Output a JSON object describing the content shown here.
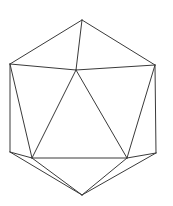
{
  "figure": {
    "stroke_color": "#3a3a3a",
    "background": "#ffffff",
    "vertices": {
      "top": [
        82,
        20
      ],
      "upper_left": [
        10,
        64
      ],
      "upper_right": [
        155,
        65
      ],
      "inner_top": [
        76,
        70
      ],
      "lower_left": [
        10,
        152
      ],
      "lower_right": [
        156,
        153
      ],
      "inner_left": [
        32,
        158
      ],
      "inner_right": [
        127,
        158
      ],
      "bottom": [
        82,
        195
      ]
    },
    "edges": [
      [
        "top",
        "upper_left"
      ],
      [
        "top",
        "upper_right"
      ],
      [
        "top",
        "inner_top"
      ],
      [
        "upper_left",
        "inner_top"
      ],
      [
        "upper_right",
        "inner_top"
      ],
      [
        "upper_left",
        "lower_left"
      ],
      [
        "upper_right",
        "lower_right"
      ],
      [
        "upper_left",
        "inner_left"
      ],
      [
        "upper_right",
        "inner_right"
      ],
      [
        "inner_top",
        "inner_left"
      ],
      [
        "inner_top",
        "inner_right"
      ],
      [
        "inner_left",
        "inner_right"
      ],
      [
        "lower_left",
        "inner_left"
      ],
      [
        "lower_right",
        "inner_right"
      ],
      [
        "lower_left",
        "bottom"
      ],
      [
        "lower_right",
        "bottom"
      ],
      [
        "inner_left",
        "bottom"
      ],
      [
        "inner_right",
        "bottom"
      ]
    ]
  }
}
